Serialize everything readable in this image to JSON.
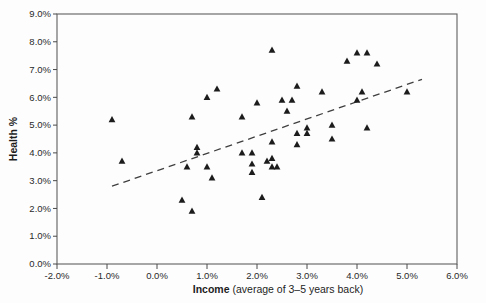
{
  "chart_data": {
    "type": "scatter",
    "title": "",
    "xlabel_bold": "Income",
    "xlabel_rest": " (average of 3–5 years back)",
    "ylabel": "Health %",
    "xlim": [
      -2,
      6
    ],
    "ylim": [
      0,
      9
    ],
    "grid": false,
    "legend": "none",
    "marker": "filled-triangle",
    "x_ticks": [
      {
        "value": -2,
        "label": "-2.0%"
      },
      {
        "value": -1,
        "label": "-1.0%"
      },
      {
        "value": 0,
        "label": "0.0%"
      },
      {
        "value": 1,
        "label": "1.0%"
      },
      {
        "value": 2,
        "label": "2.0%"
      },
      {
        "value": 3,
        "label": "3.0%"
      },
      {
        "value": 4,
        "label": "4.0%"
      },
      {
        "value": 5,
        "label": "5.0%"
      },
      {
        "value": 6,
        "label": "6.0%"
      }
    ],
    "y_ticks": [
      {
        "value": 0,
        "label": "0.0%"
      },
      {
        "value": 1,
        "label": "1.0%"
      },
      {
        "value": 2,
        "label": "2.0%"
      },
      {
        "value": 3,
        "label": "3.0%"
      },
      {
        "value": 4,
        "label": "4.0%"
      },
      {
        "value": 5,
        "label": "5.0%"
      },
      {
        "value": 6,
        "label": "6.0%"
      },
      {
        "value": 7,
        "label": "7.0%"
      },
      {
        "value": 8,
        "label": "8.0%"
      },
      {
        "value": 9,
        "label": "9.0%"
      }
    ],
    "points": [
      [
        -0.9,
        5.2
      ],
      [
        -0.7,
        3.7
      ],
      [
        0.5,
        2.3
      ],
      [
        0.6,
        3.5
      ],
      [
        0.7,
        1.9
      ],
      [
        0.7,
        5.3
      ],
      [
        0.8,
        4.2
      ],
      [
        0.8,
        4.0
      ],
      [
        1.0,
        6.0
      ],
      [
        1.0,
        3.5
      ],
      [
        1.1,
        3.1
      ],
      [
        1.2,
        6.3
      ],
      [
        1.7,
        5.3
      ],
      [
        1.7,
        4.0
      ],
      [
        1.9,
        4.0
      ],
      [
        1.9,
        3.6
      ],
      [
        1.9,
        3.3
      ],
      [
        2.0,
        5.8
      ],
      [
        2.1,
        2.4
      ],
      [
        2.2,
        3.7
      ],
      [
        2.3,
        7.7
      ],
      [
        2.3,
        4.4
      ],
      [
        2.3,
        3.8
      ],
      [
        2.3,
        3.5
      ],
      [
        2.4,
        3.5
      ],
      [
        2.5,
        5.9
      ],
      [
        2.6,
        5.5
      ],
      [
        2.7,
        5.9
      ],
      [
        2.8,
        6.4
      ],
      [
        2.8,
        4.3
      ],
      [
        2.8,
        4.7
      ],
      [
        3.0,
        4.9
      ],
      [
        3.0,
        4.7
      ],
      [
        3.3,
        6.2
      ],
      [
        3.5,
        5.0
      ],
      [
        3.5,
        4.5
      ],
      [
        3.8,
        7.3
      ],
      [
        4.0,
        7.6
      ],
      [
        4.0,
        5.9
      ],
      [
        4.1,
        6.2
      ],
      [
        4.2,
        7.6
      ],
      [
        4.2,
        4.9
      ],
      [
        4.4,
        7.2
      ],
      [
        5.0,
        6.2
      ]
    ],
    "trendline": {
      "style": "dashed",
      "x1": -0.9,
      "y1": 2.8,
      "x2": 5.3,
      "y2": 6.65
    },
    "colors": {
      "marker": "#1c1c1c",
      "frame": "#5f5f5f",
      "tick": "#4a4a4a",
      "text": "#2a2a2a",
      "trendline": "#3f3f3f",
      "plot_background": "#fdfdfd"
    }
  }
}
